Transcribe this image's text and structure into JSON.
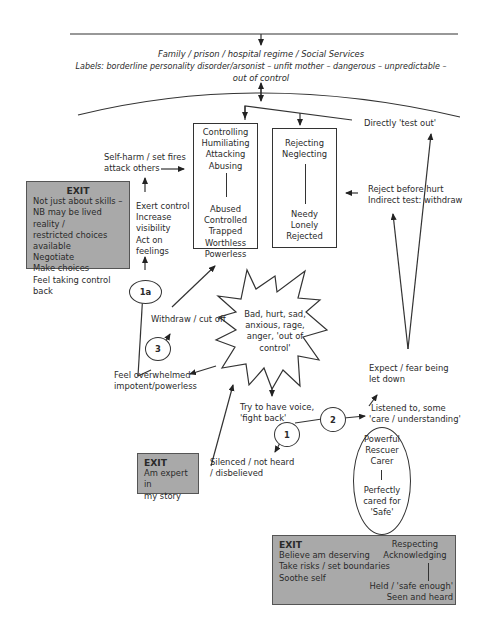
{
  "diagram": {
    "top": {
      "context": "Family / prison / hospital regime / Social Services",
      "labels_line1": "Labels: borderline personality disorder/arsonist – unfit mother – dangerous – unpredictable –",
      "labels_line2": "out of control"
    },
    "box_controlling": {
      "top": [
        "Controlling",
        "Humiliating",
        "Attacking",
        "Abusing"
      ],
      "bottom": [
        "Abused",
        "Controlled",
        "Trapped",
        "Worthless",
        "Powerless"
      ]
    },
    "box_rejecting": {
      "top": [
        "Rejecting",
        "Neglecting"
      ],
      "bottom": [
        "Needy",
        "Lonely",
        "Rejected"
      ]
    },
    "labels": {
      "directly_test_out": "Directly 'test out'",
      "self_harm_1": "Self-harm / set fires",
      "self_harm_2": "attack others",
      "exert": [
        "Exert control",
        "Increase",
        "visibility",
        "Act on",
        "feelings"
      ],
      "reject_before_1": "Reject before hurt",
      "reject_before_2": "Indirect test: withdraw",
      "withdraw": "Withdraw / cut off",
      "feel_overwhelmed_1": "Feel overwhelmed",
      "feel_overwhelmed_2": "impotent/powerless",
      "star": [
        "Bad, hurt, sad,",
        "anxious, rage,",
        "anger, 'out of",
        "control'"
      ],
      "expect_1": "Expect / fear being",
      "expect_2": "let down",
      "try_voice_1": "Try to have voice,",
      "try_voice_2": "'fight back'",
      "listened_1": "Listened to, some",
      "listened_2": "'care / understanding'",
      "silenced_1": "Silenced / not heard",
      "silenced_2": "/ disbelieved"
    },
    "ellipse": {
      "top": [
        "Powerful",
        "Rescuer",
        "Carer"
      ],
      "bottom": [
        "Perfectly",
        "cared for",
        "'Safe'"
      ]
    },
    "circles": {
      "c1a": "1a",
      "c3": "3",
      "c1": "1",
      "c2": "2"
    },
    "exit_left": {
      "title": "EXIT",
      "lines": [
        "Not just about skills –",
        "NB may be lived reality /",
        "restricted choices",
        "available",
        "Negotiate",
        "Make choices",
        "Feel taking control back"
      ]
    },
    "exit_middle": {
      "title": "EXIT",
      "lines": [
        "Am expert in",
        "my story"
      ]
    },
    "exit_bottom": {
      "title": "EXIT",
      "left_lines": [
        "Believe am deserving",
        "Take risks / set boundaries",
        "Soothe self"
      ],
      "right_top": [
        "Respecting",
        "Acknowledging"
      ],
      "right_bottom": [
        "Held / 'safe enough'",
        "Seen and heard"
      ]
    },
    "colors": {
      "exit_fill": "#a9a9a9",
      "line": "#333333"
    }
  }
}
